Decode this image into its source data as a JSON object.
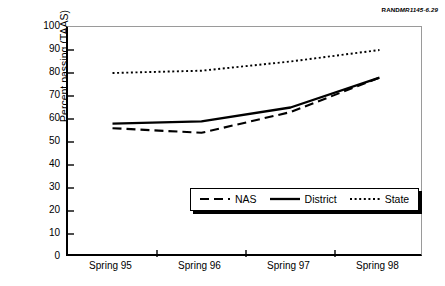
{
  "figure": {
    "rand_mark": "RAND",
    "rand_number": "MR1145-6.29"
  },
  "chart_data": {
    "type": "line",
    "title": "",
    "xlabel": "",
    "ylabel": "Percent passing (TAAS)",
    "categories": [
      "Spring 95",
      "Spring 96",
      "Spring 97",
      "Spring 98"
    ],
    "ylim": [
      0,
      100
    ],
    "ytick_step": 10,
    "yticks": [
      100,
      90,
      80,
      70,
      60,
      50,
      40,
      30,
      20,
      10,
      0
    ],
    "grid": false,
    "legend_position": "inside lower-center-right",
    "series": [
      {
        "name": "NAS",
        "style": "dashed",
        "color": "#000000",
        "values": [
          56,
          54,
          63,
          78
        ]
      },
      {
        "name": "District",
        "style": "solid",
        "color": "#000000",
        "values": [
          58,
          59,
          65,
          78
        ]
      },
      {
        "name": "State",
        "style": "dotted",
        "color": "#000000",
        "values": [
          80,
          81,
          85,
          90
        ]
      }
    ]
  }
}
